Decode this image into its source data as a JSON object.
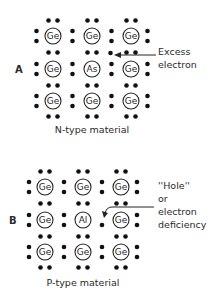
{
  "panels": [
    {
      "label": "A",
      "caption": "N-type material",
      "grid": [
        [
          "Ge",
          "Ge",
          "Ge"
        ],
        [
          "Ge",
          "As",
          "Ge"
        ],
        [
          "Ge",
          "Ge",
          "Ge"
        ]
      ],
      "annotation": [
        "Excess",
        "electron"
      ]
    },
    {
      "label": "B",
      "caption": "P-type material",
      "grid": [
        [
          "Ge",
          "Ge",
          "Ge"
        ],
        [
          "Ge",
          "Al",
          "Ge"
        ],
        [
          "Ge",
          "Ge",
          "Ge"
        ]
      ],
      "annotation": [
        "''Hole''",
        "or",
        "electron",
        "deficiency"
      ]
    }
  ]
}
